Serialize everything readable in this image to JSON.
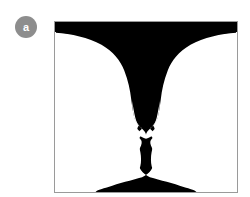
{
  "panel": {
    "label": "a",
    "label_badge_color": "#8d8d8d",
    "label_text_color": "#ffffff"
  },
  "illustration": {
    "name": "rubin-vase-figure-ground-illusion",
    "description": "Rubin vase bistable figure: a black goblet silhouette on white, or two white facing profiles on black",
    "figure_color": "#000000",
    "ground_color": "#ffffff",
    "frame_border_color": "#9a9a9a",
    "frame": {
      "x": 54,
      "y": 21,
      "width": 184,
      "height": 172
    },
    "readings": [
      "black vase / goblet",
      "two white faces in profile facing each other"
    ]
  },
  "canvas": {
    "background": "#ffffff",
    "width": 250,
    "height": 197
  }
}
